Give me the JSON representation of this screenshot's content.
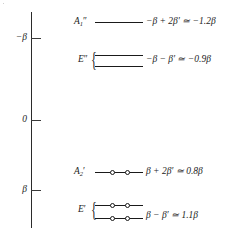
{
  "diagram": {
    "type": "molecular-orbital-energy-level-diagram",
    "axis": {
      "name": "energy-axis",
      "orientation": "vertical",
      "direction": "energy increases downward on page (negative beta at top)",
      "ticks": [
        {
          "label": "−β",
          "y": 38
        },
        {
          "label": "0",
          "y": 120
        },
        {
          "label": "β",
          "y": 190
        }
      ]
    },
    "levels": [
      {
        "term": "A",
        "term_sub": "1",
        "term_prime": "″",
        "term_full": "A₁″",
        "energy_expression": "−β + 2β′ ≃ −1.2β",
        "degeneracy": 1,
        "electrons_per_line": 0,
        "braced": false,
        "lines_y": [
          22
        ]
      },
      {
        "term": "E",
        "term_sub": "",
        "term_prime": "″",
        "term_full": "E″",
        "energy_expression": "−β − β′ ≃ −0.9β",
        "degeneracy": 2,
        "electrons_per_line": 0,
        "braced": true,
        "lines_y": [
          55,
          66
        ]
      },
      {
        "term": "A",
        "term_sub": "2",
        "term_prime": "′",
        "term_full": "A₂′",
        "energy_expression": "β + 2β′ ≃ 0.8β",
        "degeneracy": 1,
        "electrons_per_line": 2,
        "braced": false,
        "lines_y": [
          172
        ]
      },
      {
        "term": "E",
        "term_sub": "",
        "term_prime": "′",
        "term_full": "E′",
        "energy_expression": "β − β′ ≃ 1.1β",
        "degeneracy": 2,
        "electrons_per_line": 2,
        "braced": true,
        "lines_y": [
          205,
          218
        ]
      }
    ],
    "colors": {
      "ink": "#1a1a1a",
      "axis": "#2b2b2b",
      "background": "#ffffff"
    }
  }
}
